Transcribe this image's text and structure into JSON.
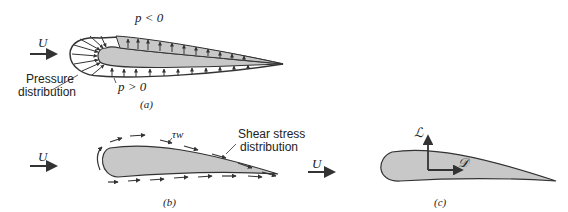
{
  "panels": {
    "a": {
      "caption": "(a)",
      "free_stream": "U",
      "suction_label": "p < 0",
      "pressure_label": "p > 0",
      "annotation": [
        "Pressure",
        "distribution"
      ]
    },
    "b": {
      "caption": "(b)",
      "free_stream": "U",
      "wall_shear": "τw",
      "annotation": [
        "Shear stress",
        "distribution"
      ]
    },
    "c": {
      "caption": "(c)",
      "free_stream": "U",
      "lift": "ℒ",
      "drag": "𝒟"
    }
  },
  "colors": {
    "airfoil_fill": "#c8c8c8",
    "stroke": "#333333"
  }
}
